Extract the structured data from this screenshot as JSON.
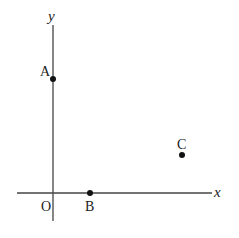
{
  "axes": {
    "x_label": "x",
    "y_label": "y",
    "origin_label": "O"
  },
  "points": [
    {
      "label": "A",
      "position": "on y-axis"
    },
    {
      "label": "B",
      "position": "on x-axis"
    },
    {
      "label": "C",
      "position": "first quadrant"
    }
  ],
  "colors": {
    "axis": "#444444",
    "point": "#111111",
    "text": "#222222"
  }
}
